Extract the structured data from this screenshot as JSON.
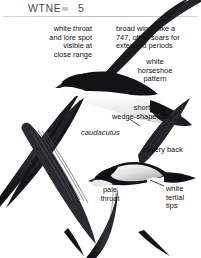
{
  "page": {
    "background_color": "#ffffff",
    "ink_color": "#111111",
    "rule_color": "#c9c9c9"
  },
  "header": {
    "title": "WTNE",
    "separator_icon": "small-grey-dash",
    "page_number": "5",
    "rule": true
  },
  "plate": {
    "subject": "white-throated-needletail-swift",
    "figure_count": 2,
    "figures": [
      {
        "name": "upper-bird-underside-soaring",
        "view": "underside"
      },
      {
        "name": "lower-bird-upperside-banking",
        "view": "upperside"
      }
    ]
  },
  "annotations": [
    {
      "id": "white-throat-lore-spot",
      "text": "white throat\nand lore spot\nvisible at\nclose range",
      "align": "right",
      "style": "plain"
    },
    {
      "id": "broad-wings-747",
      "text": "broad wings like a\n747, often soars for\nextended periods",
      "align": "left",
      "style": "plain"
    },
    {
      "id": "white-horseshoe-pattern",
      "text": "white\nhorseshoe\npattern",
      "align": "center",
      "style": "plain"
    },
    {
      "id": "short-wedge-shaped-tail",
      "text": "short\nwedge-shaped tail",
      "align": "center",
      "style": "plain"
    },
    {
      "id": "caudacutus-species-name",
      "text": "caudacutus",
      "align": "left",
      "style": "italic"
    },
    {
      "id": "silvery-back",
      "text": "silvery back",
      "align": "left",
      "style": "plain"
    },
    {
      "id": "pale-throat",
      "text": "pale\nthroat",
      "align": "center",
      "style": "plain"
    },
    {
      "id": "white-tertial-tips",
      "text": "white\ntertial\ntips",
      "align": "left",
      "style": "plain"
    }
  ]
}
